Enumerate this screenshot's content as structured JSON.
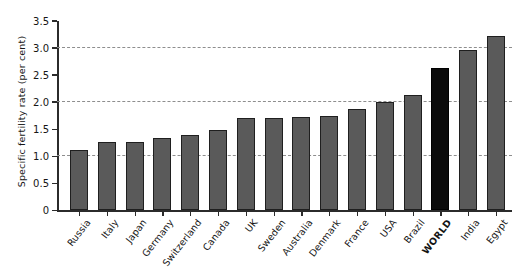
{
  "chart_data": {
    "type": "bar",
    "title": "",
    "xlabel": "",
    "ylabel": "Specific fertility rate (per cent)",
    "ylim": [
      0,
      3.5
    ],
    "yticks": [
      "0",
      "0.5",
      "1.0",
      "1.5",
      "2.0",
      "2.5",
      "3.0",
      "3.5"
    ],
    "ytick_values": [
      0,
      0.5,
      1.0,
      1.5,
      2.0,
      2.5,
      3.0,
      3.5
    ],
    "gridlines": [
      1.0,
      2.0,
      3.0
    ],
    "grid": "horizontal-dashed",
    "legend": "none",
    "categories": [
      "Russia",
      "Italy",
      "Japan",
      "Germany",
      "Switzerland",
      "Canada",
      "UK",
      "Sweden",
      "Australia",
      "Denmark",
      "France",
      "USA",
      "Brazil",
      "WORLD",
      "India",
      "Egypt"
    ],
    "values": [
      1.12,
      1.27,
      1.27,
      1.33,
      1.4,
      1.48,
      1.7,
      1.7,
      1.73,
      1.74,
      1.87,
      2.0,
      2.13,
      2.63,
      2.97,
      3.22
    ],
    "highlight_category": "WORLD",
    "bar_color": "#5a5a5a",
    "highlight_color": "#0b0b0b",
    "bar_edge_color": "#1f1f1f",
    "axis_color": "#2b2b2b",
    "gridline_color": "#8e8e8e",
    "background_color": "#ffffff"
  }
}
